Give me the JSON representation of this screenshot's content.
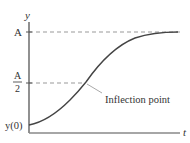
{
  "diagram": {
    "type": "logistic-curve",
    "axes": {
      "y_label": "y",
      "x_label": "t"
    },
    "levels": {
      "upper": "A",
      "half_numerator": "A",
      "half_denominator": "2",
      "initial": "y(0)"
    },
    "annotation": "Inflection point",
    "colors": {
      "axis": "#555555",
      "curve": "#444444",
      "dashed": "#999999",
      "text": "#333333"
    }
  }
}
